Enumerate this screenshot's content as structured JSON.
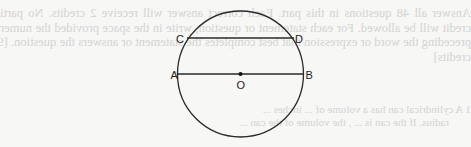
{
  "background": {
    "paper_color": "#f7f7f5",
    "show_through_color": "#d4d4d2",
    "show_through_mirrored": true,
    "instructions_text": "Answer all 48 questions in this part. Each correct answer will receive 2 credits. No partial credit will be allowed. For each statement or question, write in the space provided the numeral preceding the word or expression that best completes the statement or answers the question. [96 credits]",
    "question_line1": "1  A cylindrical can has a volume of ... inches ...",
    "question_line2": "radius. If the can is ... , the volume of the can ..."
  },
  "diagram": {
    "type": "circle-with-chords",
    "stroke_color": "#2a2a2a",
    "circle": {
      "cx": 240.5,
      "cy": 74,
      "r": 63
    },
    "center_point": {
      "label": "O",
      "x": 240.5,
      "y": 74
    },
    "chords": [
      {
        "name": "AB",
        "from": "A",
        "to": "B",
        "is_diameter": true,
        "x1": 177.5,
        "y1": 74,
        "x2": 303.5,
        "y2": 74
      },
      {
        "name": "CD",
        "from": "C",
        "to": "D",
        "is_diameter": false,
        "x1": 187,
        "y1": 38,
        "x2": 294,
        "y2": 38
      }
    ],
    "labels": {
      "A": "A",
      "B": "B",
      "C": "C",
      "D": "D",
      "O": "O"
    }
  }
}
